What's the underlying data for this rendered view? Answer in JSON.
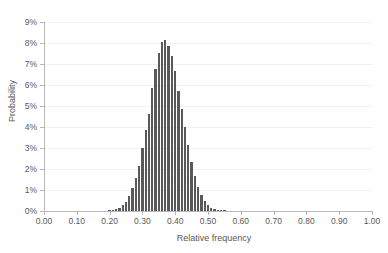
{
  "chart_data": {
    "type": "bar",
    "title": "",
    "subtitle": "",
    "xlabel": "Relative frequency",
    "ylabel": "Probability",
    "xlim": [
      0.0,
      1.0
    ],
    "ylim": [
      0.0,
      9.0
    ],
    "grid": true,
    "legend": null,
    "y_unit": "%",
    "bar_color": "#595959",
    "gridline_color": "#f2f2f2",
    "axis_color": "#b8b8b8",
    "text_color": "#595959",
    "xticks": [
      "0.00",
      "0.10",
      "0.20",
      "0.30",
      "0.40",
      "0.50",
      "0.60",
      "0.70",
      "0.80",
      "0.90",
      "1.00"
    ],
    "xtick_values": [
      0.0,
      0.1,
      0.2,
      0.3,
      0.4,
      0.5,
      0.6,
      0.7,
      0.8,
      0.9,
      1.0
    ],
    "yticks": [
      "0%",
      "1%",
      "2%",
      "3%",
      "4%",
      "5%",
      "6%",
      "7%",
      "8%",
      "9%"
    ],
    "ytick_values": [
      0,
      1,
      2,
      3,
      4,
      5,
      6,
      7,
      8,
      9
    ],
    "bar_width": 0.01,
    "categories": [
      0.2,
      0.21,
      0.22,
      0.23,
      0.24,
      0.25,
      0.26,
      0.27,
      0.28,
      0.29,
      0.3,
      0.31,
      0.32,
      0.33,
      0.34,
      0.35,
      0.36,
      0.37,
      0.38,
      0.39,
      0.4,
      0.41,
      0.42,
      0.43,
      0.44,
      0.45,
      0.46,
      0.47,
      0.48,
      0.49,
      0.5,
      0.51,
      0.52,
      0.53,
      0.54,
      0.55,
      0.56,
      0.57,
      0.58,
      0.59,
      0.6
    ],
    "values": [
      0.02,
      0.04,
      0.08,
      0.15,
      0.27,
      0.45,
      0.72,
      1.08,
      1.55,
      2.12,
      2.99,
      3.85,
      4.62,
      5.85,
      6.78,
      7.52,
      8.05,
      8.15,
      7.87,
      7.4,
      6.65,
      5.72,
      4.85,
      3.98,
      3.12,
      2.35,
      1.68,
      1.15,
      0.75,
      0.47,
      0.28,
      0.16,
      0.09,
      0.05,
      0.03,
      0.02,
      0.01,
      0.01,
      0.0,
      0.0,
      0.0
    ]
  }
}
